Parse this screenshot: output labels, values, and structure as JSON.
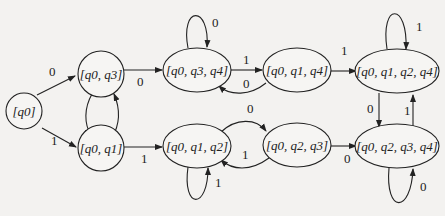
{
  "diagram": {
    "type": "DFA state diagram (subset construction)",
    "states": [
      {
        "id": "s0",
        "label": "[q0]",
        "base": [
          "q0"
        ]
      },
      {
        "id": "s1",
        "label": "[q0, q3]",
        "base": [
          "q0",
          "q3"
        ]
      },
      {
        "id": "s2",
        "label": "[q0, q1]",
        "base": [
          "q0",
          "q1"
        ]
      },
      {
        "id": "s3",
        "label": "[q0, q3, q4]",
        "base": [
          "q0",
          "q3",
          "q4"
        ]
      },
      {
        "id": "s4",
        "label": "[q0, q1, q4]",
        "base": [
          "q0",
          "q1",
          "q4"
        ]
      },
      {
        "id": "s5",
        "label": "[q0, q1, q2, q4]",
        "base": [
          "q0",
          "q1",
          "q2",
          "q4"
        ]
      },
      {
        "id": "s6",
        "label": "[q0, q1, q2]",
        "base": [
          "q0",
          "q1",
          "q2"
        ]
      },
      {
        "id": "s7",
        "label": "[q0, q2, q3]",
        "base": [
          "q0",
          "q2",
          "q3"
        ]
      },
      {
        "id": "s8",
        "label": "[q0, q2, q3, q4]",
        "base": [
          "q0",
          "q2",
          "q3",
          "q4"
        ]
      }
    ],
    "transitions": [
      {
        "from": "[q0]",
        "to": "[q0, q3]",
        "symbol": "0"
      },
      {
        "from": "[q0]",
        "to": "[q0, q1]",
        "symbol": "1"
      },
      {
        "from": "[q0, q3]",
        "to": "[q0, q1]",
        "symbol": ""
      },
      {
        "from": "[q0, q1]",
        "to": "[q0, q3]",
        "symbol": ""
      },
      {
        "from": "[q0, q3]",
        "to": "[q0, q3, q4]",
        "symbol": "0"
      },
      {
        "from": "[q0, q1]",
        "to": "[q0, q1, q2]",
        "symbol": "1"
      },
      {
        "from": "[q0, q3, q4]",
        "to": "[q0, q3, q4]",
        "symbol": "0"
      },
      {
        "from": "[q0, q3, q4]",
        "to": "[q0, q1, q4]",
        "symbol": "1"
      },
      {
        "from": "[q0, q1, q4]",
        "to": "[q0, q3, q4]",
        "symbol": "0"
      },
      {
        "from": "[q0, q1, q4]",
        "to": "[q0, q1, q2, q4]",
        "symbol": "1"
      },
      {
        "from": "[q0, q1, q2, q4]",
        "to": "[q0, q1, q2, q4]",
        "symbol": "1"
      },
      {
        "from": "[q0, q1, q2, q4]",
        "to": "[q0, q2, q3, q4]",
        "symbol": "0"
      },
      {
        "from": "[q0, q2, q3, q4]",
        "to": "[q0, q1, q2, q4]",
        "symbol": "1"
      },
      {
        "from": "[q0, q1, q2]",
        "to": "[q0, q1, q2]",
        "symbol": "1"
      },
      {
        "from": "[q0, q1, q2]",
        "to": "[q0, q2, q3]",
        "symbol": "0"
      },
      {
        "from": "[q0, q2, q3]",
        "to": "[q0, q1, q2]",
        "symbol": "1"
      },
      {
        "from": "[q0, q2, q3]",
        "to": "[q0, q2, q3, q4]",
        "symbol": "0"
      },
      {
        "from": "[q0, q2, q3, q4]",
        "to": "[q0, q2, q3, q4]",
        "symbol": "0"
      }
    ],
    "edge_labels": {
      "e_s0_s1": "0",
      "e_s0_s2": "1",
      "e_s1_s3": "0",
      "e_s2_s6": "1",
      "e_s3_loop": "0",
      "e_s3_s4": "1",
      "e_s4_s3": "0",
      "e_s4_s5": "1",
      "e_s5_loop": "1",
      "e_s5_s8": "0",
      "e_s8_s5": "1",
      "e_s6_loop": "1",
      "e_s6_s7": "0",
      "e_s7_s6": "1",
      "e_s7_s8": "0",
      "e_s8_loop": "0"
    }
  }
}
